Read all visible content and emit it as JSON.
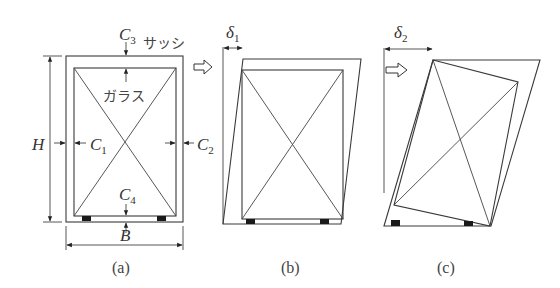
{
  "figure": {
    "panels": [
      {
        "id": "a",
        "caption": "(a)"
      },
      {
        "id": "b",
        "caption": "(b)"
      },
      {
        "id": "c",
        "caption": "(c)"
      }
    ],
    "labels": {
      "sash": "サッシ",
      "glass": "ガラス",
      "height": "H",
      "width": "B",
      "c1": {
        "main": "C",
        "sub": "1"
      },
      "c2": {
        "main": "C",
        "sub": "2"
      },
      "c3": {
        "main": "C",
        "sub": "3"
      },
      "c4": {
        "main": "C",
        "sub": "4"
      },
      "delta1": {
        "main": "δ",
        "sub": "1"
      },
      "delta2": {
        "main": "δ",
        "sub": "2"
      }
    },
    "force_arrow": "⇨"
  }
}
